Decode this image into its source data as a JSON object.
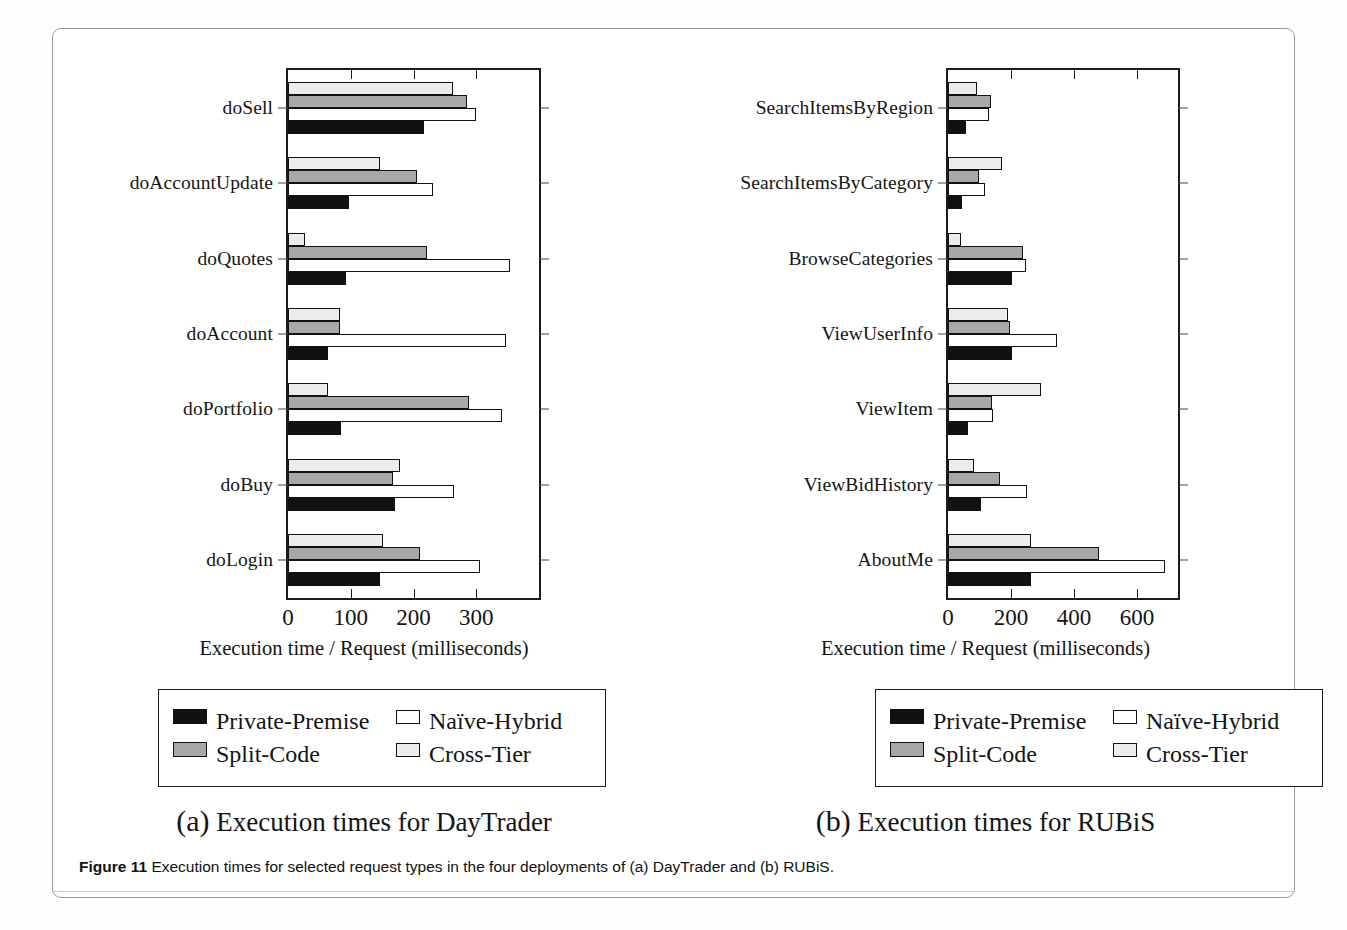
{
  "figure": {
    "number_label": "Figure 11",
    "caption": "Execution times for selected request types in the four deployments of (a) DayTrader and (b) RUBiS."
  },
  "legend": {
    "items": [
      {
        "key": "private",
        "label": "Private-Premise",
        "color": "#111111",
        "pattern": "solid-black"
      },
      {
        "key": "naive",
        "label": "Naïve-Hybrid",
        "color": "#ffffff",
        "pattern": "white-outline"
      },
      {
        "key": "split",
        "label": "Split-Code",
        "color": "#a8a8a8",
        "pattern": "solid-gray"
      },
      {
        "key": "cross",
        "label": "Cross-Tier",
        "color": "#ececec",
        "pattern": "hatched"
      }
    ]
  },
  "panel_a": {
    "subcaption_paren": "(a)",
    "subcaption_text": "Execution times for DayTrader",
    "axis_title": "Execution time / Request (milliseconds)"
  },
  "panel_b": {
    "subcaption_paren": "(b)",
    "subcaption_text": "Execution times for RUBiS",
    "axis_title": "Execution time / Request (milliseconds)"
  },
  "chart_data": [
    {
      "type": "bar",
      "orientation": "horizontal",
      "title": "(a) Execution times for DayTrader",
      "xlabel": "Execution time / Request (milliseconds)",
      "ylabel": "",
      "xlim": [
        0,
        400
      ],
      "xticks": [
        0,
        100,
        200,
        300
      ],
      "xtick_labels": [
        "0",
        "100",
        "200",
        "300"
      ],
      "grid": false,
      "legend_position": "below-plot",
      "categories": [
        "doSell",
        "doAccountUpdate",
        "doQuotes",
        "doAccount",
        "doPortfolio",
        "doBuy",
        "doLogin"
      ],
      "series": [
        {
          "name": "Cross-Tier",
          "values": [
            263,
            146,
            27,
            83,
            64,
            179,
            151
          ]
        },
        {
          "name": "Split-Code",
          "values": [
            286,
            205,
            222,
            83,
            289,
            167,
            211
          ]
        },
        {
          "name": "Naïve-Hybrid",
          "values": [
            299,
            231,
            354,
            348,
            341,
            264,
            306
          ]
        },
        {
          "name": "Private-Premise",
          "values": [
            216,
            97,
            92,
            64,
            84,
            170,
            146
          ]
        }
      ]
    },
    {
      "type": "bar",
      "orientation": "horizontal",
      "title": "(b) Execution times for RUBiS",
      "xlabel": "Execution time / Request (milliseconds)",
      "ylabel": "",
      "xlim": [
        0,
        730
      ],
      "xticks": [
        0,
        200,
        400,
        600
      ],
      "xtick_labels": [
        "0",
        "200",
        "400",
        "600"
      ],
      "grid": false,
      "legend_position": "below-plot",
      "categories": [
        "SearchItemsByRegion",
        "SearchItemsByCategory",
        "BrowseCategories",
        "ViewUserInfo",
        "ViewItem",
        "ViewBidHistory",
        "AboutMe"
      ],
      "series": [
        {
          "name": "Cross-Tier",
          "values": [
            93,
            172,
            42,
            190,
            295,
            81,
            265
          ]
        },
        {
          "name": "Split-Code",
          "values": [
            135,
            99,
            238,
            196,
            139,
            166,
            478
          ]
        },
        {
          "name": "Naïve-Hybrid",
          "values": [
            129,
            117,
            247,
            347,
            142,
            250,
            690
          ]
        },
        {
          "name": "Private-Premise",
          "values": [
            57,
            45,
            202,
            202,
            63,
            105,
            265
          ]
        }
      ]
    }
  ]
}
